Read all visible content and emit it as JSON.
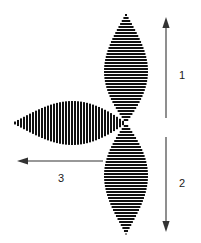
{
  "figure": {
    "title": "",
    "background_color": "#ffffff",
    "ink_color": "#000000",
    "arrow_color": "#333333",
    "label_color": "#1a1a1a",
    "canvas": {
      "width": 201,
      "height": 243
    },
    "origin": {
      "x": 126,
      "y": 123
    }
  },
  "lobes": [
    {
      "name": "upper-lobe",
      "orientation": "vertical-up",
      "stripe_direction": "horizontal",
      "stripe_period_px": 3,
      "apex": {
        "x": 126,
        "y": 13
      },
      "base": {
        "x": 126,
        "y": 123
      },
      "max_half_width_px": 22,
      "max_width_at": {
        "x": 126,
        "y": 67
      }
    },
    {
      "name": "lower-lobe",
      "orientation": "vertical-down",
      "stripe_direction": "horizontal",
      "stripe_period_px": 3,
      "apex": {
        "x": 126,
        "y": 235
      },
      "base": {
        "x": 126,
        "y": 123
      },
      "max_half_width_px": 22,
      "max_width_at": {
        "x": 126,
        "y": 181
      }
    },
    {
      "name": "left-lobe",
      "orientation": "horizontal-left",
      "stripe_direction": "vertical",
      "stripe_period_px": 3,
      "apex": {
        "x": 12,
        "y": 122
      },
      "base": {
        "x": 126,
        "y": 123
      },
      "max_half_width_px": 22,
      "max_width_at": {
        "x": 68,
        "y": 122
      }
    }
  ],
  "arrows": [
    {
      "name": "arrow-1",
      "label": "1",
      "direction": "up",
      "tail": {
        "x": 166,
        "y": 118
      },
      "head": {
        "x": 166,
        "y": 17
      },
      "label_position": {
        "x": 182,
        "y": 79
      }
    },
    {
      "name": "arrow-2",
      "label": "2",
      "direction": "down",
      "tail": {
        "x": 166,
        "y": 137
      },
      "head": {
        "x": 166,
        "y": 232
      },
      "label_position": {
        "x": 182,
        "y": 187
      }
    },
    {
      "name": "arrow-3",
      "label": "3",
      "direction": "left",
      "tail": {
        "x": 103,
        "y": 161
      },
      "head": {
        "x": 17,
        "y": 161
      },
      "label_position": {
        "x": 61,
        "y": 182
      }
    }
  ]
}
